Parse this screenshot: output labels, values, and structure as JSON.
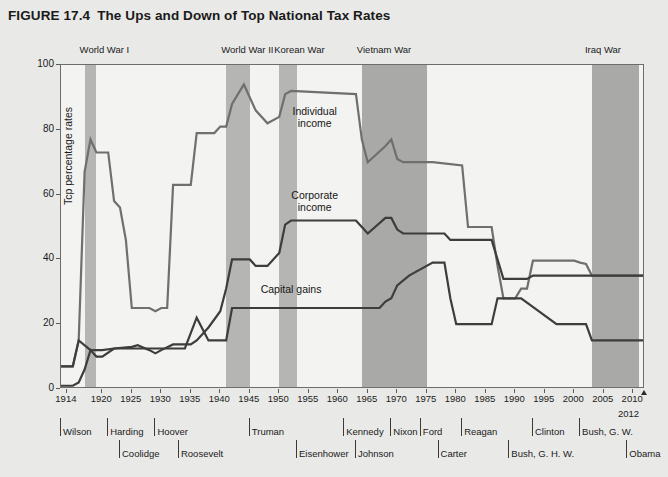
{
  "figure": {
    "number": "FIGURE 17.4",
    "title": "The Ups and Down of Top National Tax Rates"
  },
  "chart_data": {
    "type": "line",
    "title": "The Ups and Down of Top National Tax Rates",
    "xlabel": "",
    "ylabel": "Tcp percentage rates",
    "xlim": [
      1913,
      2012
    ],
    "ylim": [
      0,
      100
    ],
    "grid": false,
    "legend": "inline-labels",
    "yticks": [
      0,
      20,
      40,
      60,
      80,
      100
    ],
    "xticks": [
      1914,
      1920,
      1925,
      1930,
      1935,
      1940,
      1945,
      1950,
      1955,
      1960,
      1965,
      1970,
      1975,
      1980,
      1985,
      1990,
      1995,
      2000,
      2005,
      2010
    ],
    "x_end_label": "2012",
    "series": [
      {
        "name": "Individual income",
        "color": "#6f6f6f",
        "points": [
          [
            1913,
            7
          ],
          [
            1915,
            7
          ],
          [
            1916,
            15
          ],
          [
            1917,
            67
          ],
          [
            1918,
            77
          ],
          [
            1919,
            73
          ],
          [
            1921,
            73
          ],
          [
            1922,
            58
          ],
          [
            1923,
            56
          ],
          [
            1924,
            46
          ],
          [
            1925,
            25
          ],
          [
            1928,
            25
          ],
          [
            1929,
            24
          ],
          [
            1930,
            25
          ],
          [
            1931,
            25
          ],
          [
            1932,
            63
          ],
          [
            1935,
            63
          ],
          [
            1936,
            79
          ],
          [
            1939,
            79
          ],
          [
            1940,
            81
          ],
          [
            1941,
            81
          ],
          [
            1942,
            88
          ],
          [
            1944,
            94
          ],
          [
            1946,
            86
          ],
          [
            1948,
            82
          ],
          [
            1950,
            84
          ],
          [
            1951,
            91
          ],
          [
            1952,
            92
          ],
          [
            1963,
            91
          ],
          [
            1964,
            77
          ],
          [
            1965,
            70
          ],
          [
            1968,
            75
          ],
          [
            1969,
            77
          ],
          [
            1970,
            71
          ],
          [
            1971,
            70
          ],
          [
            1976,
            70
          ],
          [
            1981,
            69
          ],
          [
            1982,
            50
          ],
          [
            1986,
            50
          ],
          [
            1987,
            38
          ],
          [
            1988,
            28
          ],
          [
            1990,
            28
          ],
          [
            1991,
            31
          ],
          [
            1992,
            31
          ],
          [
            1993,
            39.6
          ],
          [
            2000,
            39.6
          ],
          [
            2001,
            39
          ],
          [
            2002,
            38.6
          ],
          [
            2003,
            35
          ],
          [
            2012,
            35
          ]
        ]
      },
      {
        "name": "Corporate income",
        "color": "#3d3d3d",
        "points": [
          [
            1913,
            1
          ],
          [
            1915,
            1
          ],
          [
            1916,
            2
          ],
          [
            1917,
            6
          ],
          [
            1918,
            12
          ],
          [
            1919,
            10
          ],
          [
            1920,
            10
          ],
          [
            1922,
            12.5
          ],
          [
            1925,
            13
          ],
          [
            1926,
            13.5
          ],
          [
            1928,
            12
          ],
          [
            1929,
            11
          ],
          [
            1930,
            12
          ],
          [
            1932,
            13.75
          ],
          [
            1935,
            13.75
          ],
          [
            1936,
            15
          ],
          [
            1938,
            19
          ],
          [
            1940,
            24
          ],
          [
            1941,
            31
          ],
          [
            1942,
            40
          ],
          [
            1945,
            40
          ],
          [
            1946,
            38
          ],
          [
            1948,
            38
          ],
          [
            1950,
            42
          ],
          [
            1951,
            50.75
          ],
          [
            1952,
            52
          ],
          [
            1963,
            52
          ],
          [
            1964,
            50
          ],
          [
            1965,
            48
          ],
          [
            1968,
            52.8
          ],
          [
            1969,
            52.8
          ],
          [
            1970,
            49.2
          ],
          [
            1971,
            48
          ],
          [
            1978,
            48
          ],
          [
            1979,
            46
          ],
          [
            1986,
            46
          ],
          [
            1987,
            40
          ],
          [
            1988,
            34
          ],
          [
            1992,
            34
          ],
          [
            1993,
            35
          ],
          [
            2012,
            35
          ]
        ]
      },
      {
        "name": "Capital gains",
        "color": "#3d3d3d",
        "points": [
          [
            1913,
            7
          ],
          [
            1915,
            7
          ],
          [
            1916,
            15
          ],
          [
            1918,
            12
          ],
          [
            1920,
            12
          ],
          [
            1922,
            12.5
          ],
          [
            1934,
            12.5
          ],
          [
            1936,
            22
          ],
          [
            1938,
            15
          ],
          [
            1941,
            15
          ],
          [
            1942,
            25
          ],
          [
            1967,
            25
          ],
          [
            1968,
            27
          ],
          [
            1969,
            28
          ],
          [
            1970,
            32
          ],
          [
            1972,
            35
          ],
          [
            1976,
            39
          ],
          [
            1978,
            39
          ],
          [
            1979,
            28
          ],
          [
            1980,
            20
          ],
          [
            1981,
            20
          ],
          [
            1986,
            20
          ],
          [
            1987,
            28
          ],
          [
            1990,
            28
          ],
          [
            1991,
            28
          ],
          [
            1997,
            20
          ],
          [
            2002,
            20
          ],
          [
            2003,
            15
          ],
          [
            2012,
            15
          ]
        ]
      }
    ],
    "wars": [
      {
        "label": "World War I",
        "start": 1917,
        "end": 1919
      },
      {
        "label": "World War II",
        "start": 1941,
        "end": 1945
      },
      {
        "label": "Korean War",
        "start": 1950,
        "end": 1953
      },
      {
        "label": "Vietnam War",
        "start": 1964,
        "end": 1975
      },
      {
        "label": "Iraq War",
        "start": 2003,
        "end": 2011
      }
    ],
    "series_annotations": [
      {
        "text": "Individual\nincome",
        "x": 1956,
        "y": 84
      },
      {
        "text": "Corporate\nincome",
        "x": 1956,
        "y": 58
      },
      {
        "text": "Capital gains",
        "x": 1952,
        "y": 31
      }
    ],
    "presidents_row1": [
      {
        "name": "Wilson",
        "start": 1913
      },
      {
        "name": "Harding",
        "start": 1921
      },
      {
        "name": "Hoover",
        "start": 1929
      },
      {
        "name": "Truman",
        "start": 1945
      },
      {
        "name": "Kennedy",
        "start": 1961
      },
      {
        "name": "Nixon",
        "start": 1969
      },
      {
        "name": "Ford",
        "start": 1974
      },
      {
        "name": "Reagan",
        "start": 1981
      },
      {
        "name": "Clinton",
        "start": 1993
      },
      {
        "name": "Bush, G. W.",
        "start": 2001
      }
    ],
    "presidents_row2": [
      {
        "name": "Coolidge",
        "start": 1923
      },
      {
        "name": "Roosevelt",
        "start": 1933
      },
      {
        "name": "Eisenhower",
        "start": 1953
      },
      {
        "name": "Johnson",
        "start": 1963
      },
      {
        "name": "Carter",
        "start": 1977
      },
      {
        "name": "Bush, G. H. W.",
        "start": 1989
      },
      {
        "name": "Obama",
        "start": 2009
      }
    ]
  }
}
